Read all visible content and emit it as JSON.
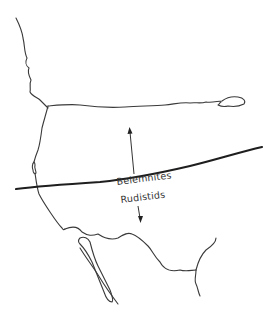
{
  "map": {
    "labels": {
      "north": "Belemnites",
      "south": "Rudistids"
    },
    "colors": {
      "coastline": "#3a3a3a",
      "boundary": "#1e1e1e",
      "text": "#333333",
      "background": "#ffffff"
    }
  }
}
